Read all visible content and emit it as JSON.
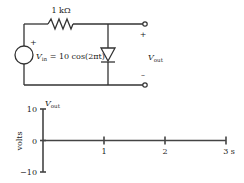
{
  "circuit": {
    "resistor_label": "1 kΩ",
    "source_plus": "+",
    "source_label_main": "V",
    "source_label_sub": "in",
    "source_label_rest": " = 10 cos(2πt)",
    "output_plus": "+",
    "output_minus": "–",
    "output_label_main": "V",
    "output_label_sub": "out"
  },
  "chart_data": {
    "type": "line",
    "title": "",
    "ylabel": "volts",
    "yaxis_title_main": "V",
    "yaxis_title_sub": "out",
    "xlabel": "",
    "ylim": [
      -10,
      10
    ],
    "xlim": [
      0,
      3
    ],
    "y_ticks": [
      {
        "value": 10,
        "label": "10"
      },
      {
        "value": 0,
        "label": "0"
      },
      {
        "value": -10,
        "label": "−10"
      }
    ],
    "x_ticks": [
      {
        "value": 1,
        "label": "1"
      },
      {
        "value": 2,
        "label": "2"
      },
      {
        "value": 3,
        "label": "3 s"
      }
    ],
    "series": []
  }
}
